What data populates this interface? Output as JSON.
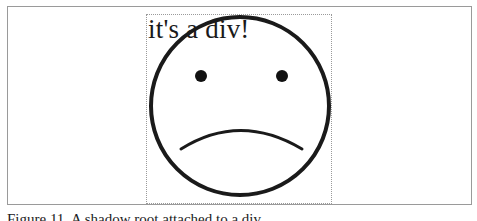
{
  "figure": {
    "div_label": "it's a div!",
    "caption": "Figure 11. A shadow root attached to a div.",
    "illustration": "sad-face",
    "colors": {
      "frame_border": "#9a9a9a",
      "dotted_border": "#9a9a9a",
      "stroke": "#1a1a1a",
      "background": "#ffffff"
    }
  }
}
